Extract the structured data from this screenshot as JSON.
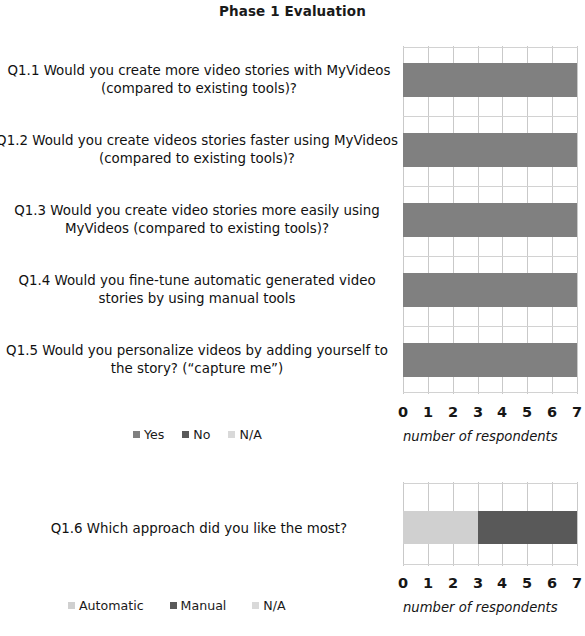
{
  "figure": {
    "title": "Phase 1 Evaluation"
  },
  "colors": {
    "yes": "#808080",
    "no": "#595959",
    "na": "#d9d9d9",
    "automatic": "#d0d0d0",
    "manual": "#595959",
    "gridline": "#c9c9c9",
    "text": "#1a1a1a"
  },
  "chart1": {
    "axis_caption": "number of respondents",
    "tick_labels": [
      "0",
      "1",
      "2",
      "3",
      "4",
      "5",
      "6",
      "7"
    ],
    "legend": [
      {
        "label": "Yes",
        "color_key": "yes"
      },
      {
        "label": "No",
        "color_key": "no"
      },
      {
        "label": "N/A",
        "color_key": "na"
      }
    ],
    "questions": [
      "Q1.1 Would you create more video stories with MyVideos (compared to existing tools)?",
      "Q1.2 Would you create videos stories faster using MyVideos (compared to existing tools)?",
      "Q1.3 Would you create video stories more easily using MyVideos (compared to existing tools)?",
      "Q1.4 Would you fine-tune automatic generated video stories by using manual tools",
      "Q1.5 Would you personalize videos by adding yourself to the story? (“capture me”)"
    ]
  },
  "chart2": {
    "axis_caption": "number of respondents",
    "tick_labels": [
      "0",
      "1",
      "2",
      "3",
      "4",
      "5",
      "6",
      "7"
    ],
    "legend": [
      {
        "label": "Automatic",
        "color_key": "automatic"
      },
      {
        "label": "Manual",
        "color_key": "manual"
      },
      {
        "label": "N/A",
        "color_key": "na"
      }
    ],
    "questions": [
      "Q1.6 Which approach did you like the most?"
    ]
  },
  "chart_data": [
    {
      "type": "bar",
      "orientation": "horizontal",
      "stacked": true,
      "title": "Phase 1 Evaluation",
      "xlabel": "number of respondents",
      "ylabel": "",
      "xlim": [
        0,
        7
      ],
      "grid": true,
      "legend_position": "bottom-left",
      "categories": [
        "Q1.1 Would you create more video stories with MyVideos (compared to existing tools)?",
        "Q1.2 Would you create videos stories faster using MyVideos (compared to existing tools)?",
        "Q1.3 Would you create video stories more easily using MyVideos (compared to existing tools)?",
        "Q1.4 Would you fine-tune automatic generated video stories by using manual tools",
        "Q1.5 Would you personalize videos by adding yourself to the story? (“capture me”)"
      ],
      "series": [
        {
          "name": "Yes",
          "values": [
            7,
            7,
            7,
            7,
            7
          ]
        },
        {
          "name": "No",
          "values": [
            0,
            0,
            0,
            0,
            0
          ]
        },
        {
          "name": "N/A",
          "values": [
            0,
            0,
            0,
            0,
            0
          ]
        }
      ]
    },
    {
      "type": "bar",
      "orientation": "horizontal",
      "stacked": true,
      "title": "",
      "xlabel": "number of respondents",
      "ylabel": "",
      "xlim": [
        0,
        7
      ],
      "grid": true,
      "legend_position": "bottom-left",
      "categories": [
        "Q1.6 Which approach did you like the most?"
      ],
      "series": [
        {
          "name": "Automatic",
          "values": [
            3
          ]
        },
        {
          "name": "Manual",
          "values": [
            4
          ]
        },
        {
          "name": "N/A",
          "values": [
            0
          ]
        }
      ]
    }
  ]
}
